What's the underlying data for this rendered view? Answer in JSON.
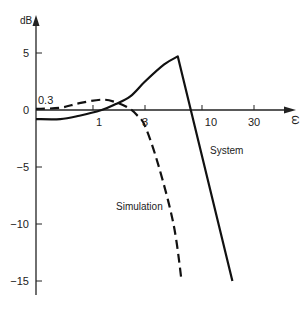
{
  "chart_data": {
    "type": "line",
    "title": "",
    "xlabel": "ω",
    "ylabel": "dB",
    "x_scale": "log",
    "x_ticks": [
      {
        "value": 1,
        "label": "1"
      },
      {
        "value": 3,
        "label": "3"
      },
      {
        "value": 10,
        "label": "10"
      },
      {
        "value": 30,
        "label": "30"
      }
    ],
    "x_origin_label": "0.3",
    "y_ticks": [
      {
        "value": 5,
        "label": "5"
      },
      {
        "value": 0,
        "label": "0"
      },
      {
        "value": -5,
        "label": "−5"
      },
      {
        "value": -10,
        "label": "−10"
      },
      {
        "value": -15,
        "label": "−15"
      }
    ],
    "xlim": [
      0.3,
      70
    ],
    "ylim": [
      -16,
      8
    ],
    "grid": false,
    "legend": "inline labels",
    "series": [
      {
        "name": "System",
        "style": "solid",
        "points": [
          [
            0.3,
            -0.8
          ],
          [
            0.5,
            -0.8
          ],
          [
            0.75,
            -0.5
          ],
          [
            1.2,
            0.0
          ],
          [
            1.6,
            0.5
          ],
          [
            2.2,
            1.2
          ],
          [
            3.0,
            2.5
          ],
          [
            4.5,
            4.0
          ],
          [
            6.0,
            4.7
          ],
          [
            19.0,
            -15.0
          ]
        ]
      },
      {
        "name": "Simulation",
        "style": "dashed",
        "points": [
          [
            0.3,
            0.1
          ],
          [
            0.5,
            0.2
          ],
          [
            0.75,
            0.6
          ],
          [
            1.2,
            0.9
          ],
          [
            1.6,
            0.7
          ],
          [
            2.1,
            0.2
          ],
          [
            2.5,
            -0.4
          ],
          [
            3.0,
            -1.4
          ],
          [
            4.0,
            -4.9
          ],
          [
            5.5,
            -10.1
          ],
          [
            6.5,
            -15.0
          ]
        ]
      }
    ],
    "annotations": [
      {
        "text": "System",
        "series": "System"
      },
      {
        "text": "Simulation",
        "series": "Simulation"
      }
    ]
  },
  "labels": {
    "ylabel": "dB",
    "xlabel": "ω",
    "origin": "0.3",
    "system": "System",
    "simulation": "Simulation"
  }
}
